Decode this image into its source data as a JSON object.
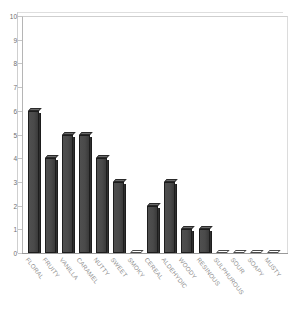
{
  "chart_data": {
    "type": "bar",
    "title": "",
    "xlabel": "",
    "ylabel": "",
    "ylim": [
      0,
      10
    ],
    "ytick_step": 1,
    "grid": false,
    "legend": "none",
    "style": "3d-column",
    "bar_color": "#4a4a4a",
    "categories": [
      "FLORAL",
      "FRUITY",
      "VANILLA",
      "CARAMEL",
      "NUTTY",
      "SWEET",
      "SMOKY",
      "CEREAL",
      "ALDEHYDIC",
      "WOODY",
      "RESINOUS",
      "SULPHUROUS",
      "SOUR",
      "SOAPY",
      "MUSTY"
    ],
    "values": [
      6,
      4,
      5,
      5,
      4,
      3,
      0,
      2,
      3,
      1,
      1,
      0,
      0,
      0,
      0
    ],
    "ytick_labels": [
      "0",
      "1",
      "2",
      "3",
      "4",
      "5",
      "6",
      "7",
      "8",
      "9",
      "10"
    ]
  },
  "axis": {
    "y_max_label": "10",
    "y_min_label": "0"
  }
}
